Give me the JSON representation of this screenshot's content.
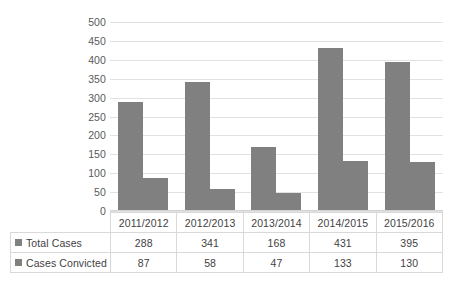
{
  "chart_data": {
    "type": "bar",
    "title": "",
    "subtitle": "",
    "xlabel": "",
    "ylabel": "",
    "ylim": [
      0,
      500
    ],
    "grid": true,
    "legend_position": "data-table-left",
    "categories": [
      "2011/2012",
      "2012/2013",
      "2013/2014",
      "2014/2015",
      "2015/2016"
    ],
    "yticks": [
      500,
      450,
      400,
      350,
      300,
      250,
      200,
      150,
      100,
      50,
      0
    ],
    "series": [
      {
        "name": "Total Cases",
        "color": "#808080",
        "values": [
          288,
          341,
          168,
          431,
          395
        ]
      },
      {
        "name": "Cases Convicted",
        "color": "#808080",
        "values": [
          87,
          58,
          47,
          133,
          130
        ]
      }
    ]
  },
  "table": {
    "header_label": "",
    "rows": [
      {
        "label": "Total Cases",
        "values": [
          "288",
          "341",
          "168",
          "431",
          "395"
        ]
      },
      {
        "label": "Cases Convicted",
        "values": [
          "87",
          "58",
          "47",
          "133",
          "130"
        ]
      }
    ]
  }
}
